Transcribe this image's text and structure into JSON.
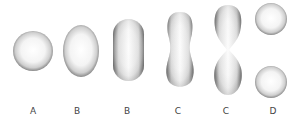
{
  "diagram": {
    "stages": [
      {
        "label": "A",
        "shape": "sphere"
      },
      {
        "label": "B",
        "shape": "ellipsoid"
      },
      {
        "label": "B",
        "shape": "capsule"
      },
      {
        "label": "C",
        "shape": "constricted-peanut"
      },
      {
        "label": "C",
        "shape": "hourglass-pinch"
      },
      {
        "label": "D",
        "shape": "two-separate-spheres"
      }
    ],
    "colors": {
      "fill_center": "#ffffff",
      "fill_edge": "#6e6e6e",
      "label": "#444444"
    }
  }
}
